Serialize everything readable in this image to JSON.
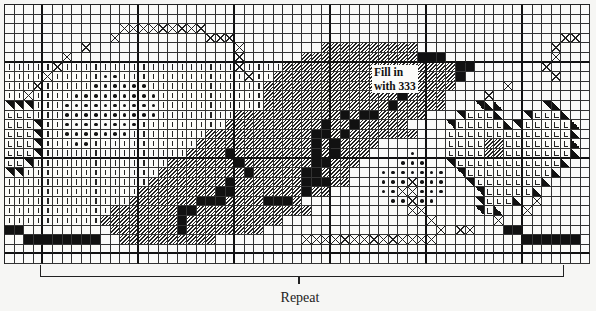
{
  "diagram": {
    "type": "cross-stitch chart",
    "annotation": "Fill in with 333",
    "annotation_lines": [
      "Fill in",
      "with 333"
    ],
    "repeat_label": "Repeat",
    "grid": {
      "cols": 61,
      "rows": 27,
      "heavy_every": 10,
      "cell_px": 9.6
    },
    "legend": {
      ".": "empty",
      "|": "vertical stitch",
      "/": "diagonal hatch",
      "#": "solid black",
      "x": "cross stitch outline",
      "o": "dot",
      "L": "L stitch",
      "t": "half triangle",
      "T": "half triangle (reverse)"
    },
    "rows": [
      ".............................................................",
      ".............................................................",
      "............xxxxxxxxx.........................................",
      "...........x.........xxx..................................xx..",
      "........x...............x........//////////..............x....",
      "......x.................x......////////////###...........x....",
      "|||||x||||||||||||||||||x||||//////////////////##.......x.....",
      "||||x|||||oo|||||||||||||x||///////////////////#.........x.....",
      "|||x|||||oooooo||||||||||||///////////////#////.....x........",
      "||x||||ooooooooo|||||||||||//////////////#////....x..........",
      "ttt|||oooooooooo|||||||||||/////////////#/////...tTT....tT....",
      "LLL|||oooooooooo||||||||///////////#/##/////...tLLLT..tLLLT...",
      "LLLt||oooooooo|||||||||//////////#//#/////....tLLLLLTtLLLLLT..",
      "LLLt||ooooooo||||||||///////////##/#///////...LLLLLLLLLLLLLT..",
      "LLLt|||oo|||||||||||////////////#/#////.......LLLL//LLLLLLLT..",
      "LLLt|||||||||||||||////#////////#/#///....o...LLLL//LLLLLLLT..",
      "LLt||||||||||||||///////#///////##///....ooo..tLLLLLLLLLLLT...",
      "tt||||||||||||||/////////#/////##///...ooooooo.tLLLLLLLLLT....",
      "|||||||||||||||////////#///////###//...oooxooo..tLLLLLLLT.....",
      "||||||||||||||////////##///////#//.....ooxxooo...tLLLLLT......",
      "|||||||||||||///////###////###/.........ooxoo....tLLLT.x......",
      "|||||||||||///////##////////////..........xx.....tLT..x........",
      "||||||||||////////#//////////...............x......x..........",
      "##.........///////#////////..................x.xx...##.......",
      "..########..//////////.........xxxxxxxxxxxxxx.........######.",
      ".............................................................",
      "............................................................."
    ]
  }
}
